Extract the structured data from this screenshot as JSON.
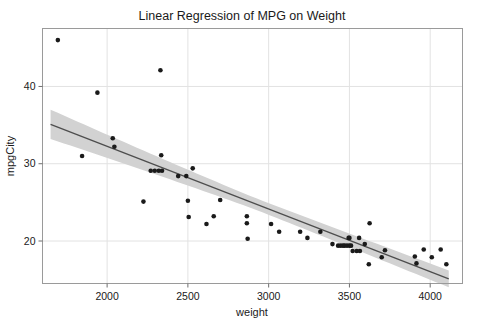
{
  "chart_data": {
    "type": "scatter",
    "title": "Linear Regression of MPG on Weight",
    "xlabel": "weight",
    "ylabel": "mpgCity",
    "xlim": [
      1600,
      4200
    ],
    "ylim": [
      14.5,
      47.5
    ],
    "xticks": [
      2000,
      2500,
      3000,
      3500,
      4000
    ],
    "yticks": [
      20,
      30,
      40
    ],
    "xtick_labels": [
      "2000",
      "2500",
      "3000",
      "3500",
      "4000"
    ],
    "ytick_labels": [
      "20",
      "30",
      "40"
    ],
    "grid": true,
    "legend": null,
    "series": [
      {
        "name": "observations",
        "marker": "filled-circle",
        "color": "#1a1a1a",
        "points": [
          [
            1695,
            46.0
          ],
          [
            1845,
            31.0
          ],
          [
            1940,
            39.2
          ],
          [
            2035,
            33.3
          ],
          [
            2045,
            32.2
          ],
          [
            2225,
            25.1
          ],
          [
            2270,
            29.1
          ],
          [
            2295,
            29.1
          ],
          [
            2320,
            29.1
          ],
          [
            2340,
            29.1
          ],
          [
            2330,
            42.1
          ],
          [
            2335,
            31.1
          ],
          [
            2440,
            28.4
          ],
          [
            2490,
            28.4
          ],
          [
            2500,
            25.2
          ],
          [
            2505,
            23.1
          ],
          [
            2530,
            29.4
          ],
          [
            2615,
            22.2
          ],
          [
            2660,
            23.2
          ],
          [
            2700,
            25.3
          ],
          [
            2865,
            23.2
          ],
          [
            2865,
            22.3
          ],
          [
            2870,
            20.3
          ],
          [
            3015,
            22.2
          ],
          [
            3065,
            21.2
          ],
          [
            3195,
            21.2
          ],
          [
            3240,
            20.4
          ],
          [
            3320,
            21.2
          ],
          [
            3395,
            19.6
          ],
          [
            3430,
            19.4
          ],
          [
            3445,
            19.4
          ],
          [
            3460,
            19.4
          ],
          [
            3470,
            19.4
          ],
          [
            3485,
            19.4
          ],
          [
            3495,
            20.4
          ],
          [
            3500,
            20.4
          ],
          [
            3500,
            19.4
          ],
          [
            3510,
            19.4
          ],
          [
            3520,
            18.7
          ],
          [
            3545,
            18.7
          ],
          [
            3560,
            20.4
          ],
          [
            3565,
            18.7
          ],
          [
            3595,
            19.6
          ],
          [
            3625,
            22.3
          ],
          [
            3620,
            17.0
          ],
          [
            3700,
            17.9
          ],
          [
            3720,
            18.8
          ],
          [
            3905,
            18.0
          ],
          [
            3915,
            17.1
          ],
          [
            3960,
            18.9
          ],
          [
            4010,
            17.9
          ],
          [
            4065,
            18.9
          ],
          [
            4100,
            17.0
          ]
        ]
      }
    ],
    "regression": {
      "name": "fitted-line",
      "color": "#4d4d4d",
      "x_start": 1650,
      "x_end": 4115,
      "y_start": 35.1,
      "y_end": 15.1,
      "band": {
        "name": "confidence-band",
        "color": "#d2d2d2",
        "upper_start": 37.0,
        "upper_end": 16.2,
        "lower_start": 33.2,
        "lower_end": 13.9,
        "waist_x": 2950,
        "waist_half_width": 0.75
      }
    }
  }
}
